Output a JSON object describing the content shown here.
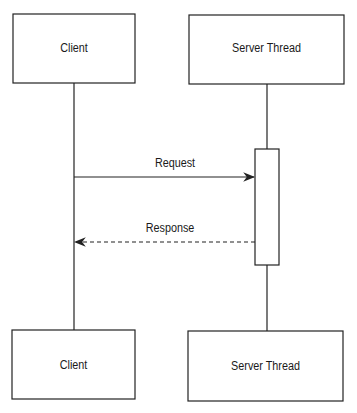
{
  "diagram": {
    "type": "sequence",
    "participants": [
      {
        "id": "client",
        "label": "Client"
      },
      {
        "id": "server",
        "label": "Server Thread"
      }
    ],
    "messages": [
      {
        "from": "client",
        "to": "server",
        "label": "Request",
        "style": "solid"
      },
      {
        "from": "server",
        "to": "client",
        "label": "Response",
        "style": "dashed"
      }
    ],
    "colors": {
      "line": "#222222",
      "background": "#ffffff"
    }
  }
}
